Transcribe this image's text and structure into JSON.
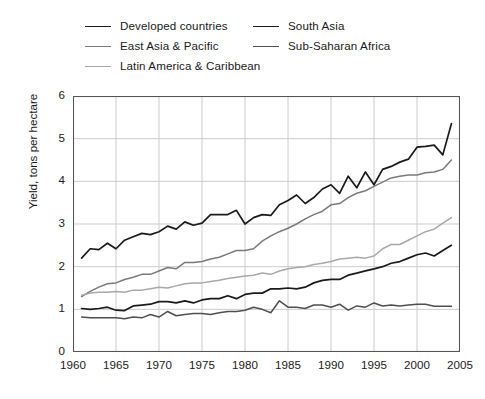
{
  "chart_data": {
    "type": "line",
    "title": "",
    "xlabel": "",
    "ylabel": "Yield, tons per hectare",
    "xlim": [
      1960,
      2005
    ],
    "ylim": [
      0,
      6
    ],
    "xticks": [
      1960,
      1965,
      1970,
      1975,
      1980,
      1985,
      1990,
      1995,
      2000,
      2005
    ],
    "yticks": [
      0,
      1,
      2,
      3,
      4,
      5,
      6
    ],
    "grid": true,
    "legend_position": "above-plot",
    "x": [
      1961,
      1962,
      1963,
      1964,
      1965,
      1966,
      1967,
      1968,
      1969,
      1970,
      1971,
      1972,
      1973,
      1974,
      1975,
      1976,
      1977,
      1978,
      1979,
      1980,
      1981,
      1982,
      1983,
      1984,
      1985,
      1986,
      1987,
      1988,
      1989,
      1990,
      1991,
      1992,
      1993,
      1994,
      1995,
      1996,
      1997,
      1998,
      1999,
      2000,
      2001,
      2002,
      2003,
      2004
    ],
    "series": [
      {
        "name": "Developed countries",
        "color": "#1a1a1a",
        "width": 1.7,
        "values": [
          2.2,
          2.42,
          2.4,
          2.55,
          2.42,
          2.62,
          2.7,
          2.78,
          2.75,
          2.82,
          2.95,
          2.88,
          3.05,
          2.97,
          3.02,
          3.22,
          3.22,
          3.22,
          3.32,
          3.0,
          3.15,
          3.22,
          3.2,
          3.45,
          3.55,
          3.68,
          3.48,
          3.62,
          3.82,
          3.92,
          3.72,
          4.12,
          3.85,
          4.22,
          3.92,
          4.28,
          4.35,
          4.45,
          4.52,
          4.8,
          4.82,
          4.85,
          4.62,
          5.35
        ]
      },
      {
        "name": "East Asia & Pacific",
        "color": "#7a7a7a",
        "width": 1.5,
        "values": [
          1.3,
          1.42,
          1.52,
          1.6,
          1.62,
          1.7,
          1.75,
          1.82,
          1.82,
          1.9,
          1.98,
          1.95,
          2.1,
          2.1,
          2.12,
          2.18,
          2.22,
          2.3,
          2.38,
          2.38,
          2.42,
          2.6,
          2.72,
          2.82,
          2.9,
          3.0,
          3.12,
          3.22,
          3.3,
          3.45,
          3.48,
          3.62,
          3.72,
          3.78,
          3.88,
          3.98,
          4.08,
          4.12,
          4.15,
          4.15,
          4.2,
          4.22,
          4.28,
          4.5
        ]
      },
      {
        "name": "Latin America & Caribbean",
        "color": "#a8a8a8",
        "width": 1.5,
        "values": [
          1.33,
          1.38,
          1.4,
          1.4,
          1.42,
          1.4,
          1.45,
          1.45,
          1.48,
          1.52,
          1.5,
          1.55,
          1.6,
          1.62,
          1.62,
          1.65,
          1.68,
          1.72,
          1.75,
          1.78,
          1.8,
          1.85,
          1.82,
          1.9,
          1.95,
          1.98,
          2.0,
          2.05,
          2.08,
          2.12,
          2.18,
          2.2,
          2.22,
          2.2,
          2.25,
          2.42,
          2.52,
          2.52,
          2.62,
          2.72,
          2.82,
          2.88,
          3.02,
          3.15
        ]
      },
      {
        "name": "South Asia",
        "color": "#1a1a1a",
        "width": 1.7,
        "values": [
          1.02,
          1.0,
          1.02,
          1.05,
          0.98,
          0.97,
          1.08,
          1.1,
          1.12,
          1.18,
          1.18,
          1.15,
          1.2,
          1.15,
          1.22,
          1.25,
          1.25,
          1.32,
          1.25,
          1.35,
          1.38,
          1.38,
          1.48,
          1.48,
          1.5,
          1.48,
          1.52,
          1.62,
          1.68,
          1.7,
          1.7,
          1.8,
          1.85,
          1.9,
          1.95,
          2.0,
          2.08,
          2.12,
          2.2,
          2.28,
          2.32,
          2.25,
          2.38,
          2.5
        ]
      },
      {
        "name": "Sub-Saharan Africa",
        "color": "#4f4f4f",
        "width": 1.5,
        "values": [
          0.82,
          0.8,
          0.8,
          0.8,
          0.8,
          0.78,
          0.82,
          0.8,
          0.88,
          0.82,
          0.95,
          0.85,
          0.88,
          0.9,
          0.9,
          0.88,
          0.92,
          0.95,
          0.95,
          0.98,
          1.05,
          1.0,
          0.92,
          1.2,
          1.05,
          1.05,
          1.02,
          1.1,
          1.1,
          1.05,
          1.12,
          0.98,
          1.08,
          1.05,
          1.15,
          1.08,
          1.1,
          1.08,
          1.1,
          1.12,
          1.12,
          1.07,
          1.07,
          1.07
        ]
      }
    ]
  },
  "legend": {
    "columns": [
      {
        "items": [
          {
            "label": "Developed countries",
            "color": "#1a1a1a",
            "width": 1.8
          },
          {
            "label": "East Asia & Pacific",
            "color": "#7a7a7a",
            "width": 1.6
          },
          {
            "label": "Latin America & Caribbean",
            "color": "#a8a8a8",
            "width": 1.6
          }
        ]
      },
      {
        "items": [
          {
            "label": "South Asia",
            "color": "#1a1a1a",
            "width": 1.8
          },
          {
            "label": "Sub-Saharan Africa",
            "color": "#4f4f4f",
            "width": 1.6
          }
        ]
      }
    ]
  },
  "axes": {
    "ylabel": "Yield, tons per hectare",
    "ytick_labels": [
      "0",
      "1",
      "2",
      "3",
      "4",
      "5",
      "6"
    ],
    "xtick_labels": [
      "1960",
      "1965",
      "1970",
      "1975",
      "1980",
      "1985",
      "1990",
      "1995",
      "2000",
      "2005"
    ]
  },
  "style": {
    "grid_color": "#cccccc",
    "frame_color": "#555555",
    "background": "#ffffff",
    "text_color": "#1a1a1a"
  }
}
